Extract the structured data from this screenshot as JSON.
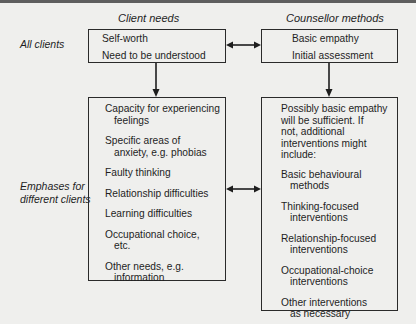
{
  "headers": {
    "client": "Client needs",
    "counsellor": "Counsellor methods"
  },
  "row_labels": {
    "all": "All clients",
    "emphases_line1": "Emphases for",
    "emphases_line2": "different clients"
  },
  "client_top": {
    "items": [
      "Self-worth",
      "Need to be understood"
    ]
  },
  "counsellor_top": {
    "items": [
      "Basic empathy",
      "Initial assessment"
    ]
  },
  "client_bottom": {
    "items": [
      {
        "first": "Capacity for experiencing",
        "cont": "feelings"
      },
      {
        "first": "Specific areas of",
        "cont": "anxiety, e.g. phobias"
      },
      {
        "first": "Faulty thinking",
        "cont": ""
      },
      {
        "first": "Relationship difficulties",
        "cont": ""
      },
      {
        "first": "Learning difficulties",
        "cont": ""
      },
      {
        "first": "Occupational choice,",
        "cont": "etc."
      },
      {
        "first": "Other needs, e.g.",
        "cont": "information"
      }
    ]
  },
  "counsellor_bottom": {
    "intro": [
      "Possibly basic empathy",
      "will be sufficient. If",
      "not, additional",
      "interventions might",
      "include:"
    ],
    "items": [
      {
        "first": "Basic behavioural",
        "cont": "methods"
      },
      {
        "first": "Thinking-focused",
        "cont": "interventions"
      },
      {
        "first": "Relationship-focused",
        "cont": "interventions"
      },
      {
        "first": "Occupational-choice",
        "cont": "interventions"
      },
      {
        "first": "Other interventions",
        "cont": "as necessary"
      }
    ]
  },
  "colors": {
    "background": "#efefed",
    "line": "#1e1e1e",
    "top_bar": "#5e5e5e"
  }
}
